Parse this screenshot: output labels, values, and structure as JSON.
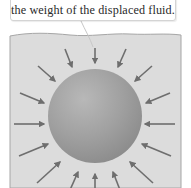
{
  "callout": {
    "text": "the weight of the displaced fluid."
  },
  "diagram": {
    "arrow_count": 16,
    "arrow_direction": "inward",
    "colors": {
      "fluid": "#d9d9d9",
      "fluid_border": "#a8a8a8",
      "sphere_light": "#b4b4b4",
      "sphere_dark": "#8e8e8e",
      "arrow": "#6e6e6e",
      "callout_border": "#d4d4d4",
      "text": "#2a2a2a"
    }
  }
}
